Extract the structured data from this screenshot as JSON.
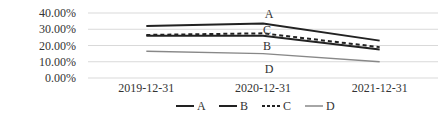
{
  "chart_data": {
    "type": "line",
    "title": "",
    "xlabel": "",
    "ylabel": "",
    "categories": [
      "2019-12-31",
      "2020-12-31",
      "2021-12-31"
    ],
    "y_ticks": [
      "0.00%",
      "10.00%",
      "20.00%",
      "30.00%",
      "40.00%"
    ],
    "ylim": [
      0,
      40
    ],
    "grid": true,
    "legend_position": "bottom",
    "series": [
      {
        "name": "A",
        "values": [
          32.0,
          33.5,
          23.0
        ],
        "style": "solid-thick",
        "color": "#222222"
      },
      {
        "name": "B",
        "values": [
          26.0,
          26.0,
          17.5
        ],
        "style": "solid-thick",
        "color": "#222222"
      },
      {
        "name": "C",
        "values": [
          26.5,
          27.5,
          19.0
        ],
        "style": "dashed",
        "color": "#222222"
      },
      {
        "name": "D",
        "values": [
          16.5,
          15.0,
          10.0
        ],
        "style": "solid-thin",
        "color": "#888888"
      }
    ],
    "annotations": [
      {
        "text": "A",
        "category": "2020-12-31",
        "near": "A"
      },
      {
        "text": "C",
        "category": "2020-12-31",
        "near": "C"
      },
      {
        "text": "B",
        "category": "2020-12-31",
        "near": "B"
      },
      {
        "text": "D",
        "category": "2020-12-31",
        "near": "D"
      }
    ]
  }
}
